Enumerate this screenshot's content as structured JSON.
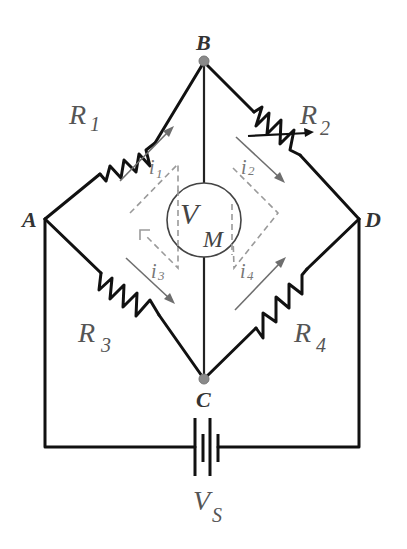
{
  "diagram": {
    "nodes": {
      "A": {
        "label": "A"
      },
      "B": {
        "label": "B"
      },
      "C": {
        "label": "C"
      },
      "D": {
        "label": "D"
      }
    },
    "resistors": [
      {
        "id": "R1",
        "symbol": "R",
        "subscript": "1",
        "between": [
          "A",
          "B"
        ],
        "variable": false
      },
      {
        "id": "R2",
        "symbol": "R",
        "subscript": "2",
        "between": [
          "B",
          "D"
        ],
        "variable": true
      },
      {
        "id": "R3",
        "symbol": "R",
        "subscript": "3",
        "between": [
          "A",
          "C"
        ],
        "variable": false
      },
      {
        "id": "R4",
        "symbol": "R",
        "subscript": "4",
        "between": [
          "C",
          "D"
        ],
        "variable": false
      }
    ],
    "currents": [
      {
        "id": "i1",
        "symbol": "i",
        "subscript": "1",
        "branch": "R1"
      },
      {
        "id": "i2",
        "symbol": "i",
        "subscript": "2",
        "branch": "R2"
      },
      {
        "id": "i3",
        "symbol": "i",
        "subscript": "3",
        "branch": "R3"
      },
      {
        "id": "i4",
        "symbol": "i",
        "subscript": "4",
        "branch": "R4"
      }
    ],
    "meter": {
      "symbol": "V",
      "subscript": "M",
      "between": [
        "B",
        "C"
      ]
    },
    "source": {
      "symbol": "V",
      "subscript": "S",
      "between": [
        "A",
        "D"
      ]
    },
    "colors": {
      "wire": "#111111",
      "node": "#8a8a8a",
      "current_arrow": "#6e6e6e",
      "dashed_loop": "#9a9a9a",
      "label": "#555555"
    }
  }
}
